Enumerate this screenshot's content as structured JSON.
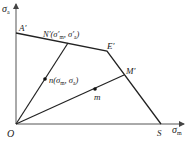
{
  "diagram": {
    "type": "fatigue limit stress diagram",
    "axes": {
      "x": {
        "symbol": "σ",
        "subscript": "m"
      },
      "y": {
        "symbol": "σ",
        "subscript": "a"
      },
      "origin": "O"
    },
    "points": {
      "A_prime": "A′",
      "E_prime": "E′",
      "S": "S",
      "M_prime": "M′",
      "m": "m",
      "n": {
        "name": "n",
        "coords": "(σm, σa)"
      },
      "N_prime": {
        "name": "N′",
        "coords": "(σ′m, σ′a)"
      }
    },
    "colors": {
      "line": "#222222",
      "axis": "#555555",
      "background": "#ffffff"
    }
  }
}
